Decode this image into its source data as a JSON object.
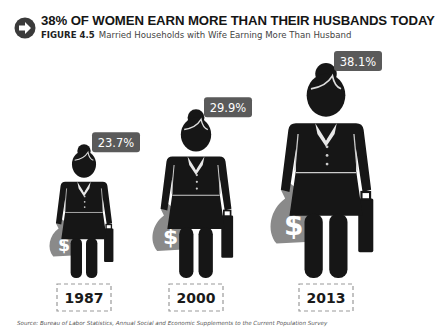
{
  "header": {
    "icon": "arrow-right-circle-icon",
    "title": "38% OF WOMEN EARN MORE THAN THEIR HUSBANDS TODAY",
    "figure_label": "FIGURE 4.5",
    "subtitle": "Married Households with Wife Earning More Than Husband"
  },
  "chart_data": {
    "type": "bar",
    "title": "38% OF WOMEN EARN MORE THAN THEIR HUSBANDS TODAY",
    "subtitle": "FIGURE 4.5 Married Households with Wife Earning More Than Husband",
    "categories": [
      "1987",
      "2000",
      "2013"
    ],
    "values": [
      23.7,
      29.9,
      38.1
    ],
    "value_labels": [
      "23.7%",
      "29.9%",
      "38.1%"
    ],
    "unit": "%",
    "xlabel": "",
    "ylabel": "",
    "mark": "pictogram-woman-with-money-bag",
    "grid": false,
    "legend": "none",
    "colors": {
      "figure": "#161616",
      "money_bag": "#8a8a8a",
      "label_bg": "#5a5a5a",
      "label_text": "#ffffff",
      "year_border": "#9a9a9a"
    }
  },
  "source": "Source: Bureau of Labor Statistics, Annual Social and Economic Supplements to the Current Population Survey"
}
